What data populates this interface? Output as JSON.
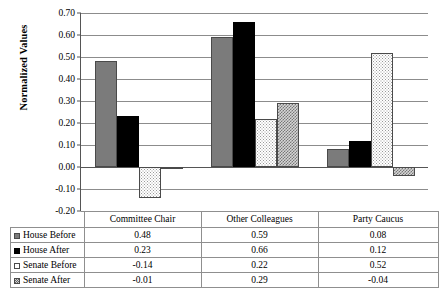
{
  "chart_data": {
    "type": "bar",
    "title": "",
    "xlabel": "",
    "ylabel": "Normalized Values",
    "ylim": [
      -0.2,
      0.7
    ],
    "ytick_labels": [
      "0.70",
      "0.60",
      "0.50",
      "0.40",
      "0.30",
      "0.20",
      "0.10",
      "0.00",
      "-0.10",
      "-0.20"
    ],
    "ytick_values": [
      0.7,
      0.6,
      0.5,
      0.4,
      0.3,
      0.2,
      0.1,
      0.0,
      -0.1,
      -0.2
    ],
    "grid": true,
    "legend_position": "data-table-left",
    "categories": [
      "Committee Chair",
      "Other Colleagues",
      "Party Caucus"
    ],
    "series": [
      {
        "name": "House Before",
        "values": [
          0.48,
          0.59,
          0.08
        ],
        "labels": [
          "0.48",
          "0.59",
          "0.08"
        ],
        "color": "#7b7b7b",
        "pattern": "solid-gray"
      },
      {
        "name": "House After",
        "values": [
          0.23,
          0.66,
          0.12
        ],
        "labels": [
          "0.23",
          "0.66",
          "0.12"
        ],
        "color": "#000000",
        "pattern": "solid-black"
      },
      {
        "name": "Senate Before",
        "values": [
          -0.14,
          0.22,
          0.52
        ],
        "labels": [
          "-0.14",
          "0.22",
          "0.52"
        ],
        "color": "#ffffff",
        "pattern": "light-dotted"
      },
      {
        "name": "Senate After",
        "values": [
          -0.01,
          0.29,
          -0.04
        ],
        "labels": [
          "-0.01",
          "0.29",
          "-0.04"
        ],
        "color": "#d6d6d6",
        "pattern": "gray-checkered"
      }
    ]
  }
}
